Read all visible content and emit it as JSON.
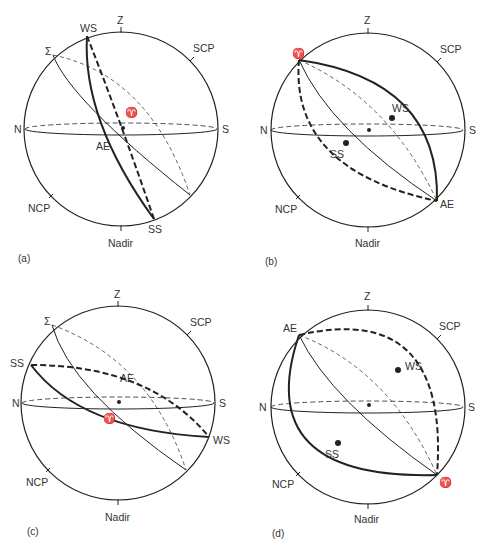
{
  "panels": [
    {
      "id": "a",
      "caption": "(a)",
      "labels": {
        "zenith": "Z",
        "nadir": "Nadir",
        "north": "N",
        "south": "S",
        "scp": "SCP",
        "ncp": "NCP",
        "winter_solstice": "WS",
        "summer_solstice": "SS",
        "autumnal_equinox": "AE",
        "ecliptic_pole": "Σ",
        "vernal_equinox": "♈"
      }
    },
    {
      "id": "b",
      "caption": "(b)",
      "labels": {
        "zenith": "Z",
        "nadir": "Nadir",
        "north": "N",
        "south": "S",
        "scp": "SCP",
        "ncp": "NCP",
        "winter_solstice": "WS",
        "summer_solstice": "SS",
        "autumnal_equinox": "AE",
        "vernal_equinox": "♈"
      }
    },
    {
      "id": "c",
      "caption": "(c)",
      "labels": {
        "zenith": "Z",
        "nadir": "Nadir",
        "north": "N",
        "south": "S",
        "scp": "SCP",
        "ncp": "NCP",
        "winter_solstice": "WS",
        "summer_solstice": "SS",
        "autumnal_equinox": "AE",
        "ecliptic_pole": "Σ",
        "vernal_equinox": "♈"
      }
    },
    {
      "id": "d",
      "caption": "(d)",
      "labels": {
        "zenith": "Z",
        "nadir": "Nadir",
        "north": "N",
        "south": "S",
        "scp": "SCP",
        "ncp": "NCP",
        "winter_solstice": "WS",
        "summer_solstice": "SS",
        "autumnal_equinox": "AE",
        "vernal_equinox": "♈"
      }
    }
  ]
}
